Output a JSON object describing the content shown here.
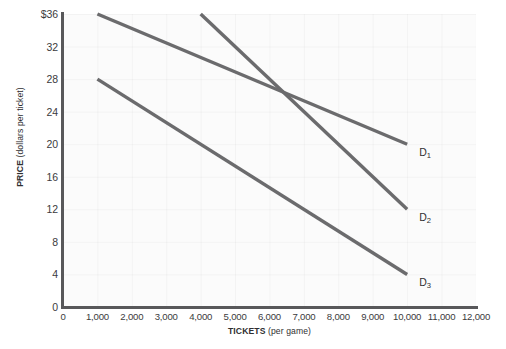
{
  "chart_data": {
    "type": "line",
    "title": "",
    "xlabel_bold": "TICKETS",
    "xlabel_rest": "(per game)",
    "ylabel_bold": "PRICE",
    "ylabel_rest": "(dollars per ticket)",
    "xlim": [
      0,
      12000
    ],
    "ylim": [
      0,
      36
    ],
    "grid": true,
    "legend_position": "inline-right-of-curve",
    "x_ticks": [
      {
        "value": 0,
        "label": "0"
      },
      {
        "value": 1000,
        "label": "1,000"
      },
      {
        "value": 2000,
        "label": "2,000"
      },
      {
        "value": 3000,
        "label": "3,000"
      },
      {
        "value": 4000,
        "label": "4,000"
      },
      {
        "value": 5000,
        "label": "5,000"
      },
      {
        "value": 6000,
        "label": "6,000"
      },
      {
        "value": 7000,
        "label": "7,000"
      },
      {
        "value": 8000,
        "label": "8,000"
      },
      {
        "value": 9000,
        "label": "9,000"
      },
      {
        "value": 10000,
        "label": "10,000"
      },
      {
        "value": 11000,
        "label": "11,000"
      },
      {
        "value": 12000,
        "label": "12,000"
      }
    ],
    "y_ticks": [
      {
        "value": 36,
        "label": "$36"
      },
      {
        "value": 32,
        "label": "32"
      },
      {
        "value": 28,
        "label": "28"
      },
      {
        "value": 24,
        "label": "24"
      },
      {
        "value": 20,
        "label": "20"
      },
      {
        "value": 16,
        "label": "16"
      },
      {
        "value": 12,
        "label": "12"
      },
      {
        "value": 8,
        "label": "8"
      },
      {
        "value": 4,
        "label": "4"
      },
      {
        "value": 0,
        "label": "0"
      }
    ],
    "line_color": "#6b6b6d",
    "line_width": 3.4,
    "series": [
      {
        "name": "D1",
        "label_text": "D",
        "label_sub": "1",
        "points": [
          {
            "x": 1000,
            "y": 36
          },
          {
            "x": 10000,
            "y": 20
          }
        ],
        "label_at": {
          "x": 10350,
          "y": 19.1
        }
      },
      {
        "name": "D2",
        "label_text": "D",
        "label_sub": "2",
        "points": [
          {
            "x": 4000,
            "y": 36
          },
          {
            "x": 10000,
            "y": 12
          }
        ],
        "label_at": {
          "x": 10350,
          "y": 11.1
        }
      },
      {
        "name": "D3",
        "label_text": "D",
        "label_sub": "3",
        "points": [
          {
            "x": 1000,
            "y": 28
          },
          {
            "x": 10000,
            "y": 4
          }
        ],
        "label_at": {
          "x": 10350,
          "y": 3.1
        }
      }
    ]
  }
}
